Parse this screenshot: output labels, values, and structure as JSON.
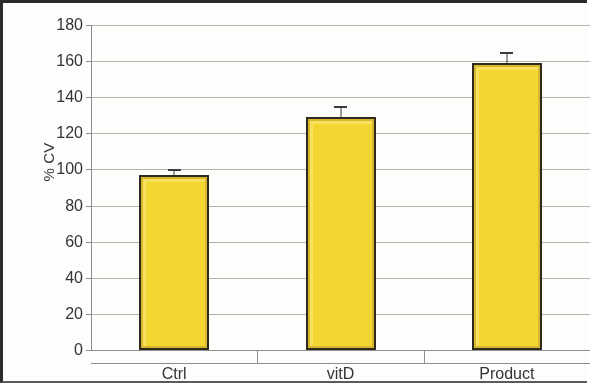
{
  "chart_data": {
    "type": "bar",
    "title": "",
    "subtitle": "",
    "xlabel": "",
    "ylabel": "% CV",
    "categories": [
      "Ctrl",
      "vitD",
      "Product"
    ],
    "values": [
      97,
      129,
      159
    ],
    "error_upper": [
      100,
      135,
      165
    ],
    "errors": [
      3,
      6,
      6
    ],
    "ylim": [
      0,
      180
    ],
    "ytick_labels": [
      "0",
      "20",
      "40",
      "60",
      "80",
      "100",
      "120",
      "140",
      "160",
      "180"
    ],
    "ytick_values": [
      0,
      20,
      40,
      60,
      80,
      100,
      120,
      140,
      160,
      180
    ],
    "grid": true,
    "legend": "none",
    "series": [
      {
        "name": "% CV",
        "values": [
          97,
          129,
          159
        ],
        "color": "#F4D62C",
        "edge_color": "#2F2A1C"
      }
    ],
    "annotations": []
  },
  "axes": {
    "y_title": "% CV"
  }
}
